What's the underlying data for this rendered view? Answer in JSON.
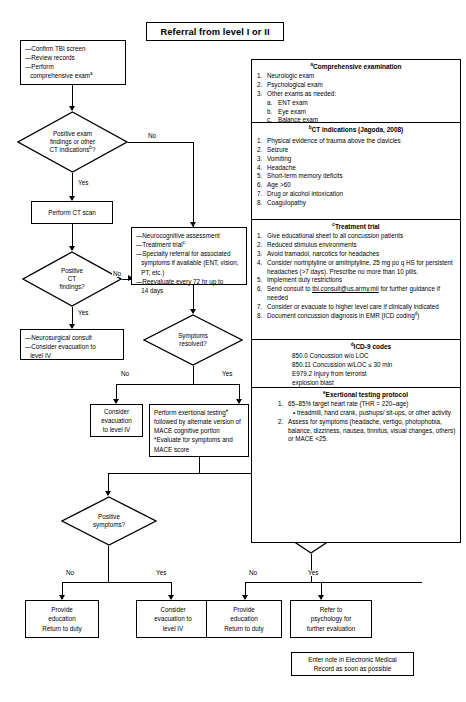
{
  "title_box": {
    "label": "Referral from level I or II"
  },
  "nodes": {
    "initial_actions": {
      "lines": [
        "—Confirm TBI screen",
        "—Review records",
        "—Perform",
        "   comprehensive examᵃ"
      ]
    },
    "decision_positive_exam": {
      "lines": [
        "Positive exam",
        "findings or other",
        "CT indicationsᵇ?"
      ]
    },
    "perform_ct": {
      "label": "Perform CT scan"
    },
    "decision_ct_findings": {
      "lines": [
        "Positive",
        "CT",
        "findings?"
      ]
    },
    "neurosurgical": {
      "lines": [
        "—Neurosurgical consult",
        "—Consider evacuation to",
        "   level IV"
      ]
    },
    "management": {
      "lines": [
        "—Neurocognitive assessment",
        "—Treatment trialᶜ",
        "—Specialty referral for associated",
        "   symptoms if available (ENT, vision,",
        "   PT, etc.)",
        "—Reevaluate every 72 hr up to",
        "   14 days"
      ]
    },
    "decision_symptoms_resolved": {
      "lines": [
        "Symptoms",
        "resolved?"
      ]
    },
    "consider_evac_level_iv": {
      "lines": [
        "Consider",
        "evacuation",
        "to level IV"
      ]
    },
    "exertional_testing": {
      "lines": [
        "Perform exertional testingᵉ",
        "followed by alternate",
        "version of MACE cognitive",
        "portion",
        "*Evaluate for symptoms",
        "and MACE score"
      ]
    },
    "decision_positive_symptoms": {
      "lines": [
        "Positive",
        "symptoms?"
      ]
    },
    "decision_no_symptoms_mace": {
      "lines": [
        "No",
        "symptoms",
        "but MACE",
        "<25?"
      ]
    },
    "provide_education_left": {
      "lines": [
        "Provide",
        "education",
        "Return to duty"
      ]
    },
    "consider_evac_right": {
      "lines": [
        "Consider",
        "evacuation to",
        "level IV"
      ]
    },
    "provide_education_right": {
      "lines": [
        "Provide",
        "education",
        "Return to duty"
      ]
    },
    "refer_psychology": {
      "lines": [
        "Refer to",
        "psychology for",
        "further evaluation"
      ]
    },
    "emr_note": {
      "lines": [
        "Enter note in Electronic Medical",
        "Record as soon as possible"
      ]
    }
  },
  "edge_labels": {
    "no_exam": "No",
    "yes_exam": "Yes",
    "no_ct": "No",
    "yes_ct": "Yes",
    "no_symptoms_resolved": "No",
    "yes_symptoms_resolved": "Yes",
    "no_positive_symptoms": "No",
    "yes_positive_symptoms": "Yes",
    "no_mace": "No",
    "yes_mace": "Yes"
  },
  "panel": {
    "comprehensive_examination": {
      "heading": "Comprehensive examination",
      "heading_sup": "a",
      "items": [
        {
          "num": "1.",
          "text": "Neurologic exam"
        },
        {
          "num": "2.",
          "text": "Psychological exam"
        },
        {
          "num": "3.",
          "text": "Other exams as needed:"
        }
      ],
      "subitems": [
        {
          "num": "a.",
          "text": "ENT exam"
        },
        {
          "num": "b.",
          "text": "Eye exam"
        },
        {
          "num": "c.",
          "text": "Balance exam"
        }
      ]
    },
    "ct_indications": {
      "heading": "CT indications (Jagoda, 2008)",
      "heading_sup": "b",
      "items": [
        {
          "num": "1.",
          "text": "Physical evidence of trauma above the clavicles"
        },
        {
          "num": "2.",
          "text": "Seizure"
        },
        {
          "num": "3.",
          "text": "Vomiting"
        },
        {
          "num": "4.",
          "text": "Headache"
        },
        {
          "num": "5.",
          "text": "Short-term memory deficits"
        },
        {
          "num": "6.",
          "text": "Age >60"
        },
        {
          "num": "7.",
          "text": "Drug or alcohol intoxication"
        },
        {
          "num": "8.",
          "text": "Coagulopathy"
        }
      ]
    },
    "treatment_trial": {
      "heading": "Treatment trial",
      "heading_sup": "c",
      "items": [
        {
          "num": "1.",
          "text": "Give educational sheet to all concussion patients"
        },
        {
          "num": "2.",
          "text": "Reduced stimulus environments"
        },
        {
          "num": "3.",
          "text": "Avoid tramadol, narcotics for headaches"
        },
        {
          "num": "4.",
          "text": "Consider nortriptyline or amitriptyline, 25 mg po q HS for persistent headaches (>7 days). Prescribe no more than 10 pills."
        },
        {
          "num": "5.",
          "text": "Implement duty restrictions"
        },
        {
          "num": "6.",
          "text": "Send consult to tbi.consult@us.army.mil for further guidance if needed"
        },
        {
          "num": "7.",
          "text": "Consider or evacuate to higher level care if clinically indicated"
        },
        {
          "num": "8.",
          "text": "Document concussion diagnosis in EMR (ICD codingᵈ)"
        }
      ],
      "link_text": "tbi.consult@us.army.mil"
    },
    "icd9_codes": {
      "heading": "ICD-9 codes",
      "heading_sup": "d",
      "lines": [
        "850.0 Concussion w/o LOC",
        "850.11 Concussion w/LOC ≤ 30 min",
        "E979.2 Injury from terrorist",
        "explosion blast"
      ]
    },
    "exertional_protocol": {
      "heading": "Exertional testing protocol",
      "heading_sup": "e",
      "items": [
        {
          "num": "1.",
          "text": "65–85% target heart rate (THR = 220–age)"
        },
        {
          "num": "2.",
          "text": "Assess for symptoms (headache, vertigo, photophobia, balance, dizziness, nausea, tinnitus, visual changes, others) or MACE <25."
        }
      ],
      "bullet": "• treadmill, hand crank, pushups/ sit-ups, or other activity"
    }
  },
  "colors": {
    "ink": "#000000",
    "paper": "#ffffff"
  }
}
